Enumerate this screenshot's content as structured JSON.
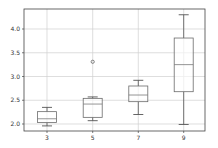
{
  "chart_data": {
    "type": "box",
    "title": "",
    "xlabel": "",
    "ylabel": "",
    "categories": [
      "3",
      "5",
      "7",
      "9"
    ],
    "boxes": [
      {
        "label": "3",
        "whisker_low": 1.96,
        "q1": 2.03,
        "median": 2.11,
        "q3": 2.26,
        "whisker_high": 2.35,
        "outliers": []
      },
      {
        "label": "5",
        "whisker_low": 2.07,
        "q1": 2.14,
        "median": 2.42,
        "q3": 2.54,
        "whisker_high": 2.57,
        "outliers": [
          3.31
        ]
      },
      {
        "label": "7",
        "whisker_low": 2.2,
        "q1": 2.47,
        "median": 2.61,
        "q3": 2.8,
        "whisker_high": 2.92,
        "outliers": []
      },
      {
        "label": "9",
        "whisker_low": 1.99,
        "q1": 2.68,
        "median": 3.25,
        "q3": 3.81,
        "whisker_high": 4.3,
        "outliers": []
      }
    ],
    "yticks": [
      2.0,
      2.5,
      3.0,
      3.5,
      4.0
    ],
    "ytick_labels": [
      "2.0",
      "2.5",
      "3.0",
      "3.5",
      "4.0"
    ],
    "ylim": [
      1.85,
      4.4
    ],
    "grid": true,
    "legend": null
  },
  "colors": {
    "box": "#6b6b6b",
    "median": "#7a7a7a",
    "whisker": "#555555",
    "grid": "#d0d0d0",
    "axis": "#444444"
  }
}
